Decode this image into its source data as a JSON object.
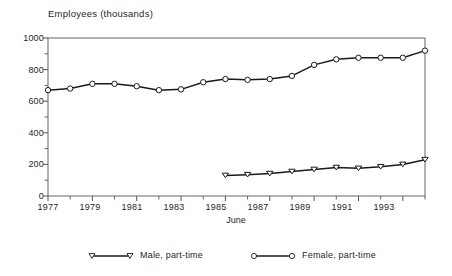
{
  "chart_data": {
    "type": "line",
    "title": "",
    "ylabel": "Employees (thousands)",
    "xlabel": "June",
    "ylim": [
      0,
      1000
    ],
    "xlim": [
      1977,
      1994
    ],
    "y_ticks": [
      0,
      200,
      400,
      600,
      800,
      1000
    ],
    "y_minor_ticks": [
      100,
      300,
      500,
      700,
      900
    ],
    "x_ticks": [
      1977,
      1979,
      1981,
      1983,
      1985,
      1987,
      1989,
      1991,
      1993
    ],
    "x_minor_ticks": [
      1978,
      1980,
      1982,
      1984,
      1986,
      1988,
      1990,
      1992,
      1994
    ],
    "grid": false,
    "legend_position": "bottom",
    "series": [
      {
        "name": "Male, part-time",
        "marker": "triangle-down",
        "x": [
          1985,
          1986,
          1987,
          1988,
          1989,
          1990,
          1991,
          1992,
          1993,
          1994
        ],
        "values": [
          130,
          135,
          142,
          155,
          168,
          180,
          175,
          185,
          200,
          230
        ]
      },
      {
        "name": "Female, part-time",
        "marker": "circle",
        "x": [
          1977,
          1978,
          1979,
          1980,
          1981,
          1982,
          1983,
          1984,
          1985,
          1986,
          1987,
          1988,
          1989,
          1990,
          1991,
          1992,
          1993,
          1994
        ],
        "values": [
          670,
          680,
          710,
          710,
          695,
          670,
          675,
          720,
          740,
          735,
          740,
          760,
          830,
          865,
          875,
          875,
          875,
          920
        ]
      }
    ]
  },
  "axis": {
    "y_tick_labels": [
      "1000",
      "800",
      "600",
      "400",
      "200",
      "0"
    ],
    "x_tick_labels": [
      "1977",
      "1979",
      "1981",
      "1983",
      "1985",
      "1987",
      "1989",
      "1991",
      "1993"
    ],
    "y_axis_title": "Employees (thousands)",
    "x_axis_title": "June"
  },
  "legend": {
    "items": [
      {
        "label": "Male, part-time",
        "marker": "triangle-down-marker"
      },
      {
        "label": "Female, part-time",
        "marker": "circle-marker"
      }
    ]
  },
  "colors": {
    "line": "#1a1a1a",
    "marker_fill": "#ffffff",
    "axis": "#555555",
    "text": "#1f1f1f"
  }
}
